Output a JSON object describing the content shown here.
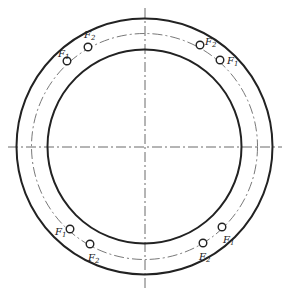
{
  "diagram": {
    "type": "bolted flange ring – bolt hole layout",
    "center": {
      "x": 144.5,
      "y": 146.5
    },
    "circles": {
      "outer_radius": 128,
      "pitch_radius": 113,
      "inner_radius": 97
    },
    "centerlines": {
      "horizontal": {
        "x1": 8,
        "x2": 282,
        "y": 147
      },
      "vertical": {
        "x": 145,
        "y1": 8,
        "y2": 290
      }
    },
    "colors": {
      "line": "#222222",
      "background": "#ffffff"
    },
    "holes": [
      {
        "id": "tl-1",
        "x": 67,
        "y": 61,
        "label": "F",
        "sub": "1",
        "lx": 58,
        "ly": 57
      },
      {
        "id": "tl-2",
        "x": 88,
        "y": 47,
        "label": "F",
        "sub": "2",
        "lx": 84,
        "ly": 38
      },
      {
        "id": "tr-2",
        "x": 200,
        "y": 45,
        "label": "F",
        "sub": "2",
        "lx": 205,
        "ly": 45
      },
      {
        "id": "tr-1",
        "x": 220,
        "y": 60,
        "label": "F",
        "sub": "1",
        "lx": 227,
        "ly": 64
      },
      {
        "id": "bl-1",
        "x": 70,
        "y": 229,
        "label": "F",
        "sub": "1",
        "lx": 55,
        "ly": 235
      },
      {
        "id": "bl-2",
        "x": 90,
        "y": 244,
        "label": "F",
        "sub": "2",
        "lx": 88,
        "ly": 261
      },
      {
        "id": "br-1",
        "x": 222,
        "y": 227,
        "label": "F",
        "sub": "1",
        "lx": 223,
        "ly": 243
      },
      {
        "id": "br-2",
        "x": 203,
        "y": 243,
        "label": "F",
        "sub": "2",
        "lx": 199,
        "ly": 260
      }
    ]
  }
}
